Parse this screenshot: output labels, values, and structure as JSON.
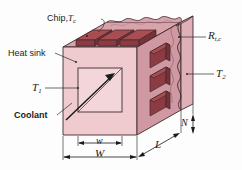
{
  "figure": {
    "title_text": "",
    "colors": {
      "background": "#fdfdfd",
      "front_face": "#efcbd0",
      "top_face": "#d9a3ab",
      "side_face": "#cf98a2",
      "right_slab_face": "#dfb0b8",
      "right_slab_edge": "#c08d97",
      "chip_top": "#a84d52",
      "chip_front": "#8d3b42",
      "chip_side": "#7a3036",
      "cavity_fill": "#f3d6da",
      "outline": "#3c2a2c",
      "leader_line": "#2b2b2b",
      "text": "#1b1b1b"
    },
    "labels": {
      "chip": {
        "text": "Chip,",
        "symbol": "T",
        "subscript": "c"
      },
      "heat_sink": {
        "text": "Heat sink"
      },
      "t1": {
        "symbol": "T",
        "subscript": "1"
      },
      "coolant": {
        "text": "Coolant"
      },
      "contact_resistance": {
        "symbol": "R",
        "subscript": "t,c"
      },
      "t2": {
        "symbol": "T",
        "subscript": "2"
      },
      "dim_w_small": {
        "symbol": "w"
      },
      "dim_w_large": {
        "symbol": "W"
      },
      "dim_l": {
        "symbol": "L"
      },
      "dim_n": {
        "symbol": "N"
      }
    },
    "counts": {
      "chips_top": 3,
      "chips_right": 3
    }
  }
}
